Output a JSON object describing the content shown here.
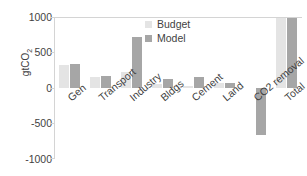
{
  "chart_data": {
    "type": "bar",
    "title": "",
    "subtitle": "",
    "xlabel": "",
    "ylabel": "gtCO2",
    "ylabel_display": "gtCO",
    "ylabel_sub": "2",
    "categories": [
      "Gen",
      "Transport",
      "Industry",
      "Bldgs",
      "Cement",
      "Land",
      "CO2 removal",
      "Total"
    ],
    "series": [
      {
        "name": "Budget",
        "color": "#e4e4e4",
        "values": [
          320,
          160,
          230,
          60,
          25,
          65,
          0,
          985
        ]
      },
      {
        "name": "Model",
        "color": "#a6a6a6",
        "values": [
          345,
          165,
          720,
          120,
          150,
          70,
          -660,
          990
        ]
      }
    ],
    "ylim": [
      -1000,
      1000
    ],
    "yticks": [
      1000,
      500,
      0,
      -500,
      -1000
    ],
    "ytick_labels": [
      "1000",
      "500",
      "0",
      "-500",
      "-1000"
    ],
    "grid": false,
    "legend_position": "upper-center",
    "zero_line": true
  },
  "axis": {
    "y_title": "gtCO",
    "y_title_sub": "2",
    "tick_1000": "1000",
    "tick_500": "500",
    "tick_0": "0",
    "tick_neg500": "-500",
    "tick_neg1000": "-1000"
  },
  "legend": {
    "items": [
      {
        "label": "Budget",
        "swatch": "budget-swatch"
      },
      {
        "label": "Model",
        "swatch": "model-swatch"
      }
    ]
  },
  "colors": {
    "budget": "#e4e4e4",
    "model": "#a6a6a6",
    "text": "#3f3f3f",
    "axis": "#d4d4d4",
    "background": "#ffffff"
  }
}
